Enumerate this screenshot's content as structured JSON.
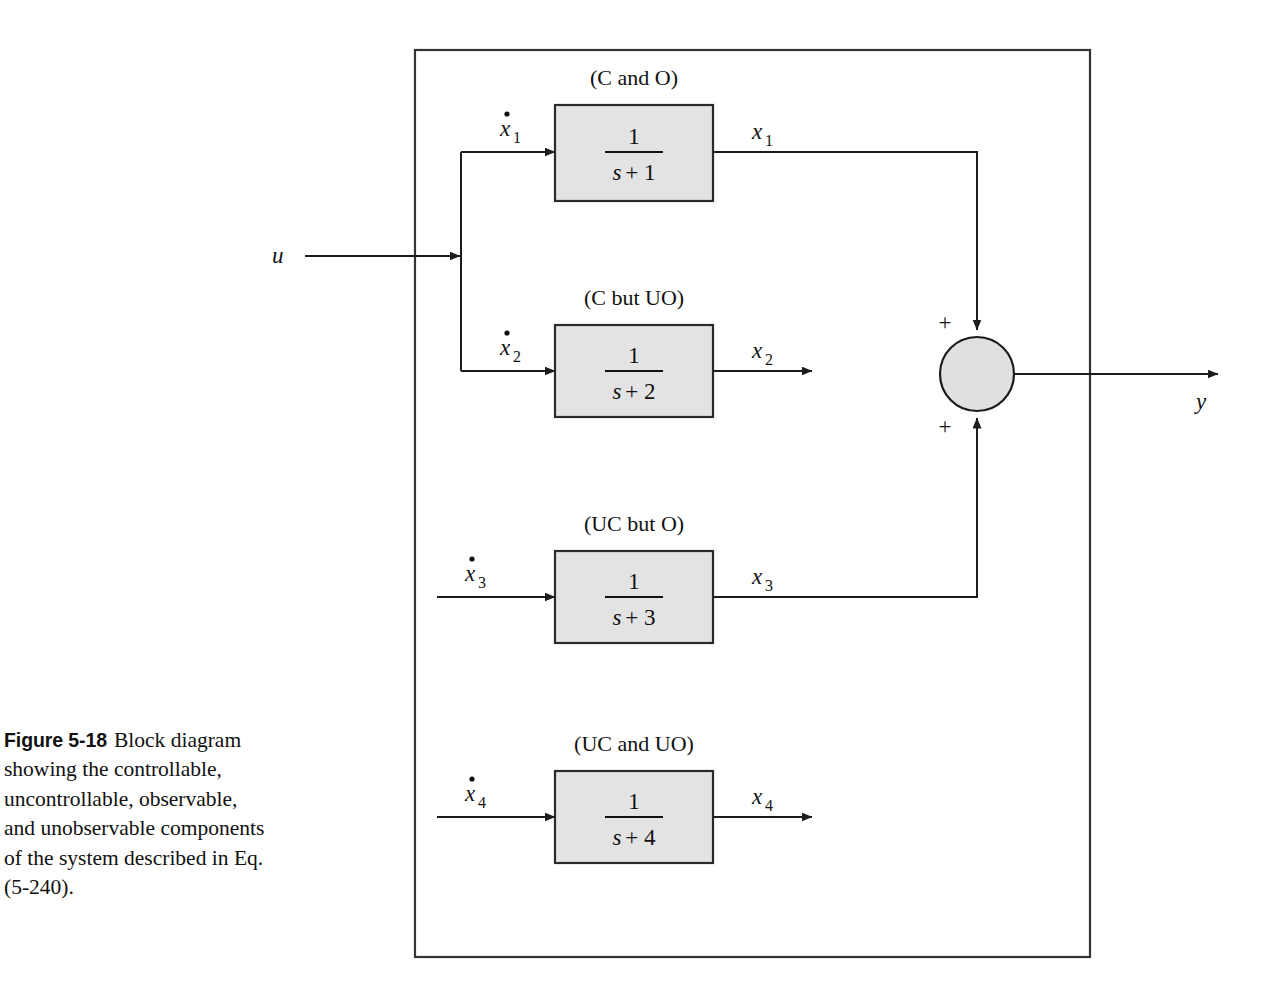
{
  "figure": {
    "label": "Figure 5-18",
    "caption": "Block diagram showing the controllable, uncontrollable, observable, and unobservable components of the system described in Eq. (5-240)."
  },
  "diagram": {
    "type": "block-diagram",
    "input_signal": "u",
    "output_signal": "y",
    "border": "outer system boundary rectangle",
    "summing_junction": {
      "name": "sum-junction",
      "inputs": [
        {
          "signal": "x1",
          "sign": "+",
          "side": "top"
        },
        {
          "signal": "x3",
          "sign": "+",
          "side": "bottom"
        }
      ],
      "output": "y",
      "fill": "#e0e0e0"
    },
    "blocks": [
      {
        "id": "block-1",
        "tag": "(C and O)",
        "numerator": "1",
        "denominator_s": "s",
        "denominator_rest": "+ 1",
        "input_label": "x",
        "input_sub": "1",
        "output_label": "x",
        "output_sub": "1",
        "input_is_derivative": true,
        "feeds": "summing-junction",
        "fill": "#e3e3e3"
      },
      {
        "id": "block-2",
        "tag": "(C but UO)",
        "numerator": "1",
        "denominator_s": "s",
        "denominator_rest": "+ 2",
        "input_label": "x",
        "input_sub": "2",
        "output_label": "x",
        "output_sub": "2",
        "input_is_derivative": true,
        "feeds": "open-output",
        "fill": "#e3e3e3"
      },
      {
        "id": "block-3",
        "tag": "(UC but O)",
        "numerator": "1",
        "denominator_s": "s",
        "denominator_rest": "+ 3",
        "input_label": "x",
        "input_sub": "3",
        "output_label": "x",
        "output_sub": "3",
        "input_is_derivative": true,
        "feeds": "summing-junction",
        "fill": "#e3e3e3"
      },
      {
        "id": "block-4",
        "tag": "(UC and UO)",
        "numerator": "1",
        "denominator_s": "s",
        "denominator_rest": "+ 4",
        "input_label": "x",
        "input_sub": "4",
        "output_label": "x",
        "output_sub": "4",
        "input_is_derivative": true,
        "feeds": "open-output",
        "fill": "#e3e3e3"
      }
    ],
    "signs": {
      "top": "+",
      "bottom": "+"
    }
  }
}
